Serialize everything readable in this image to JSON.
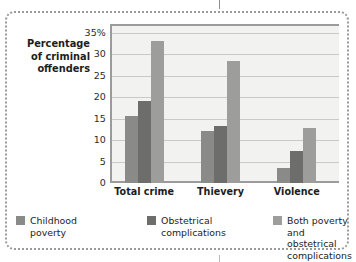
{
  "chart_data": {
    "type": "bar",
    "title": "",
    "subtitle": "",
    "xlabel": "",
    "ylabel": "Percentage of criminal offenders",
    "ylabel_lines": [
      "Percentage",
      "of criminal",
      "offenders"
    ],
    "categories": [
      "Total crime",
      "Thievery",
      "Violence"
    ],
    "series": [
      {
        "name": "Childhood poverty",
        "name_lines": [
          "Childhood",
          "poverty"
        ],
        "color": "#8a8a88",
        "values": [
          15.5,
          12.0,
          3.5
        ]
      },
      {
        "name": "Obstetrical complications",
        "name_lines": [
          "Obstetrical",
          "complications"
        ],
        "color": "#6d6d6b",
        "values": [
          19.0,
          13.3,
          7.5
        ]
      },
      {
        "name": "Both poverty and obstetrical complications",
        "name_lines": [
          "Both poverty and",
          "obstetrical complications"
        ],
        "color": "#9d9d9b",
        "values": [
          33.0,
          28.3,
          12.7
        ]
      }
    ],
    "ylim": [
      0,
      37
    ],
    "yticks": [
      0,
      5,
      10,
      15,
      20,
      25,
      30,
      35
    ],
    "ytick_labels": [
      "0",
      "5",
      "10",
      "15",
      "20",
      "25",
      "30",
      "35%"
    ],
    "grid": true,
    "legend_position": "bottom",
    "plot_background": "#f2f2f0",
    "axis_color": "#9b9b9b",
    "gridline_color": "#c9c9c7",
    "frame_color": "#9a9a9a"
  }
}
